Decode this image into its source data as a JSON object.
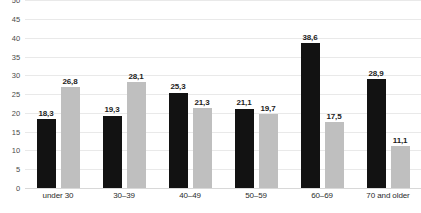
{
  "chart_data": {
    "type": "bar",
    "title": "",
    "xlabel": "",
    "ylabel": "",
    "ylim": [
      0,
      50
    ],
    "yticks": [
      0,
      5,
      10,
      15,
      20,
      25,
      30,
      35,
      40,
      45,
      50
    ],
    "ytick_labels": [
      "0",
      "5",
      "10",
      "15",
      "20",
      "25",
      "30",
      "35",
      "40",
      "45",
      "50"
    ],
    "grid": true,
    "legend": "none",
    "decimal_separator": ",",
    "categories": [
      "under 30",
      "30–39",
      "40–49",
      "50–59",
      "60–69",
      "70 and older"
    ],
    "series": [
      {
        "name": "series-1",
        "color": "#121212",
        "values": [
          18.3,
          19.3,
          25.3,
          21.1,
          38.6,
          28.9
        ],
        "labels": [
          "18,3",
          "19,3",
          "25,3",
          "21,1",
          "38,6",
          "28,9"
        ]
      },
      {
        "name": "series-2",
        "color": "#bfbfbf",
        "values": [
          26.8,
          28.1,
          21.3,
          19.7,
          17.5,
          11.1
        ],
        "labels": [
          "26,8",
          "28,1",
          "21,3",
          "19,7",
          "17,5",
          "11,1"
        ]
      }
    ]
  }
}
